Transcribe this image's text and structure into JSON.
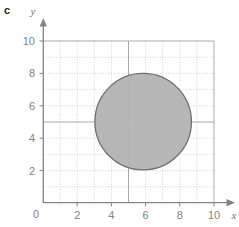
{
  "part_label": "c",
  "axes": {
    "x_name": "x",
    "y_name": "y",
    "origin_label": "0",
    "x_ticks": [
      "2",
      "4",
      "6",
      "8",
      "10"
    ],
    "y_ticks": [
      "10",
      "8",
      "6",
      "4",
      "2"
    ],
    "x_range": [
      0,
      10
    ],
    "y_range": [
      0,
      10
    ],
    "grid": "on"
  },
  "colors": {
    "shape_fill": "#b3b3b3",
    "shape_stroke": "#6d6e71",
    "axis": "#808285",
    "major_grid": "#a7a9ac",
    "minor_grid": "#bcbec0",
    "label": "#231f20",
    "tick": "#808285"
  },
  "chart_data": {
    "type": "scatter",
    "title": "",
    "xlabel": "x",
    "ylabel": "y",
    "xlim": [
      0,
      10
    ],
    "ylim": [
      0,
      10
    ],
    "xticks": [
      0,
      2,
      4,
      6,
      8,
      10
    ],
    "yticks": [
      0,
      2,
      4,
      6,
      8,
      10
    ],
    "grid": true,
    "legend": "none",
    "shapes": [
      {
        "kind": "circle",
        "center_x": 5.85,
        "center_y": 5.0,
        "radius": 2.9,
        "fill": "#b3b3b3",
        "stroke": "#6d6e71",
        "label": ""
      }
    ],
    "annotations": [
      "c"
    ]
  }
}
